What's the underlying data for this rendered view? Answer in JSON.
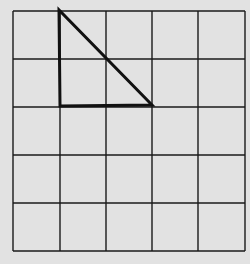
{
  "diagram": {
    "type": "grid-with-triangle",
    "background": "#e2e2e2",
    "grid": {
      "rows": 5,
      "cols": 5,
      "x_lines": [
        13,
        60,
        106,
        152,
        198,
        245
      ],
      "y_lines": [
        11,
        59,
        107,
        155,
        203,
        251
      ],
      "line_color": "#1a1a1a",
      "line_width": 1.4
    },
    "triangle": {
      "vertices": [
        [
          59,
          10
        ],
        [
          60,
          106
        ],
        [
          152,
          105
        ]
      ],
      "stroke": "#111111",
      "stroke_width": 3,
      "description": "Right triangle spanning 1 cell wide by 2 cells high from grid column 1 to 3"
    }
  }
}
